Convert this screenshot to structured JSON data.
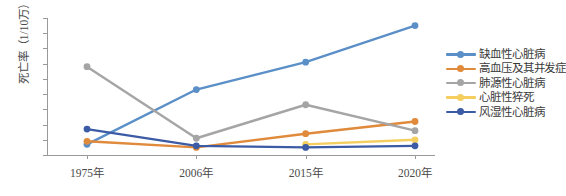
{
  "chart_data": {
    "type": "line",
    "title": "",
    "xlabel": "",
    "ylabel": "死亡率（1/10万）",
    "categories": [
      "1975年",
      "2006年",
      "2015年",
      "2020年"
    ],
    "ylim": [
      0,
      90
    ],
    "yticks": [
      0,
      10,
      20,
      30,
      40,
      50,
      60,
      70,
      80,
      90
    ],
    "grid": false,
    "legend_position": "right",
    "series": [
      {
        "name": "缺血性心脏病",
        "color": "#5B8FC7",
        "values": [
          7,
          43,
          61,
          85
        ]
      },
      {
        "name": "高血压及其并发症",
        "color": "#E08A3C",
        "values": [
          9,
          5,
          14,
          22
        ]
      },
      {
        "name": "肺源性心脏病",
        "color": "#A5A5A5",
        "values": [
          58,
          11,
          33,
          16
        ]
      },
      {
        "name": "心脏性猝死",
        "color": "#F4CE5E",
        "values": [
          null,
          null,
          7,
          10
        ]
      },
      {
        "name": "风湿性心脏病",
        "color": "#3B5BA5",
        "values": [
          17,
          6,
          5,
          6
        ]
      }
    ]
  }
}
